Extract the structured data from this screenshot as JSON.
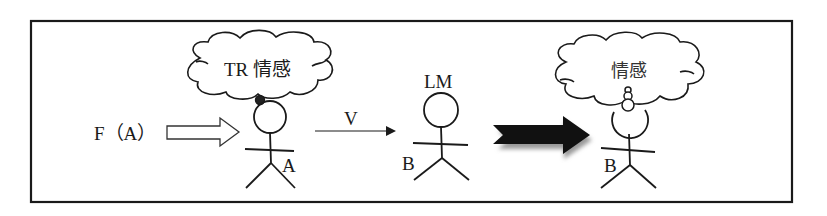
{
  "diagram": {
    "actor_a": {
      "thought_label": "TR 情感",
      "name_label": "A",
      "force_label": "F（A）"
    },
    "transfer": {
      "verb_label": "V"
    },
    "actor_b_before": {
      "role_label": "LM",
      "name_label": "B"
    },
    "actor_b_after": {
      "thought_label": "情感",
      "name_label": "B"
    },
    "colors": {
      "stroke": "#1a1a1a",
      "background": "#ffffff",
      "result_arrow": "#111111"
    }
  }
}
